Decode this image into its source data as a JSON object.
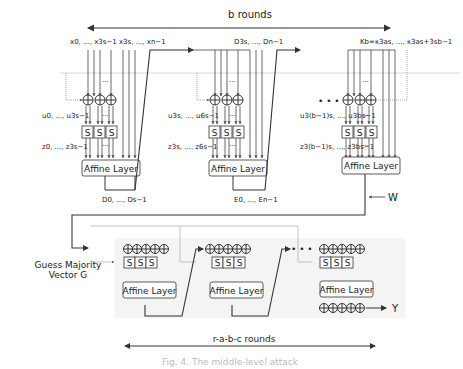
{
  "diagram": {
    "top_span_label": "b rounds",
    "bottom_span_label": "r-a-b-c rounds",
    "caption": "Fig. 4. The middle-level attack",
    "round1": {
      "input_label": "x0, ..., x3s−1  x3s, ..., xn−1",
      "u_label": "u0, ..., u3s−1",
      "z_label": "z0, ..., z3s−1",
      "affine_label": "Affine Layer",
      "output_label": "D0, ..., Ds−1"
    },
    "round2": {
      "input_label": "D3s, ..., Dn−1",
      "u_label": "u3s, ..., u6s−1",
      "z_label": "z3s, ..., z6s−1",
      "affine_label": "Affine Layer",
      "output_label": "E0, ..., En−1"
    },
    "round3": {
      "input_label": "Kb=κ3as, ..., κ3as+3sb−1",
      "u_label": "u3(b−1)s, ..., u3bs−1",
      "z_label": "z3(b−1)s, ..., z3bs−1",
      "affine_label": "Affine Layer"
    },
    "sbox_label": "S",
    "dots": "...",
    "ellipsis_big": "• • •",
    "w_label": "W",
    "y_label": "Y",
    "guess_label_line1": "Guess Majority",
    "guess_label_line2": "Vector G",
    "lower_blocks": [
      {
        "affine_label": "Affine Layer"
      },
      {
        "affine_label": "Affine Layer"
      },
      {
        "affine_label": "Affine Layer"
      }
    ]
  }
}
